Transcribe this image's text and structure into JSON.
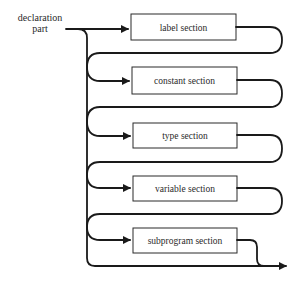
{
  "diagram": {
    "type": "syntax-diagram",
    "entry_label": {
      "line1": "declaration",
      "line2": "part"
    },
    "sections": [
      {
        "label": "label section"
      },
      {
        "label": "constant section"
      },
      {
        "label": "type section"
      },
      {
        "label": "variable section"
      },
      {
        "label": "subprogram section"
      }
    ],
    "colors": {
      "stroke": "#1a1a1a",
      "background": "#ffffff"
    }
  }
}
